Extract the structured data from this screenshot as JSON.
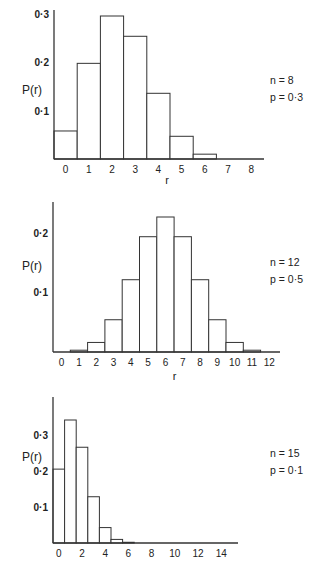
{
  "chart_data": [
    {
      "type": "bar",
      "title": "",
      "xlabel": "r",
      "ylabel": "P(r)",
      "annotation": [
        "n = 8",
        "p = 0·3"
      ],
      "categories": [
        "0",
        "1",
        "2",
        "3",
        "4",
        "5",
        "6",
        "7",
        "8"
      ],
      "values": [
        0.058,
        0.198,
        0.296,
        0.254,
        0.136,
        0.047,
        0.01,
        0.001,
        0.0001
      ],
      "yticks": [
        "0·1",
        "0·2",
        "0·3"
      ],
      "ytick_values": [
        0.1,
        0.2,
        0.3
      ],
      "xtick_labels": [
        "0",
        "1",
        "2",
        "3",
        "4",
        "5",
        "6",
        "7",
        "8"
      ],
      "ylim": [
        0,
        0.33
      ],
      "grid": false
    },
    {
      "type": "bar",
      "title": "",
      "xlabel": "r",
      "ylabel": "P(r)",
      "annotation": [
        "n = 12",
        "p = 0·5"
      ],
      "categories": [
        "0",
        "1",
        "2",
        "3",
        "4",
        "5",
        "6",
        "7",
        "8",
        "9",
        "10",
        "11",
        "12"
      ],
      "values": [
        0.0002,
        0.003,
        0.016,
        0.054,
        0.121,
        0.193,
        0.226,
        0.193,
        0.121,
        0.054,
        0.016,
        0.003,
        0.0002
      ],
      "yticks": [
        "0·1",
        "0·2"
      ],
      "ytick_values": [
        0.1,
        0.2
      ],
      "xtick_labels": [
        "0",
        "1",
        "2",
        "3",
        "4",
        "5",
        "6",
        "7",
        "8",
        "9",
        "10",
        "11",
        "12"
      ],
      "ylim": [
        0,
        0.26
      ],
      "grid": false
    },
    {
      "type": "bar",
      "title": "",
      "xlabel": "",
      "ylabel": "P(r)",
      "annotation": [
        "n = 15",
        "p = 0·1"
      ],
      "categories": [
        "0",
        "1",
        "2",
        "3",
        "4",
        "5",
        "6",
        "7",
        "8",
        "9",
        "10",
        "11",
        "12",
        "13",
        "14",
        "15"
      ],
      "values": [
        0.206,
        0.343,
        0.267,
        0.129,
        0.043,
        0.01,
        0.002,
        0.0003,
        0,
        0,
        0,
        0,
        0,
        0,
        0,
        0
      ],
      "yticks": [
        "0·1",
        "0·2",
        "0·3"
      ],
      "ytick_values": [
        0.1,
        0.2,
        0.3
      ],
      "xtick_labels": [
        "0",
        "2",
        "4",
        "6",
        "8",
        "10",
        "12",
        "14"
      ],
      "ylim": [
        0,
        0.38
      ],
      "grid": false
    }
  ]
}
